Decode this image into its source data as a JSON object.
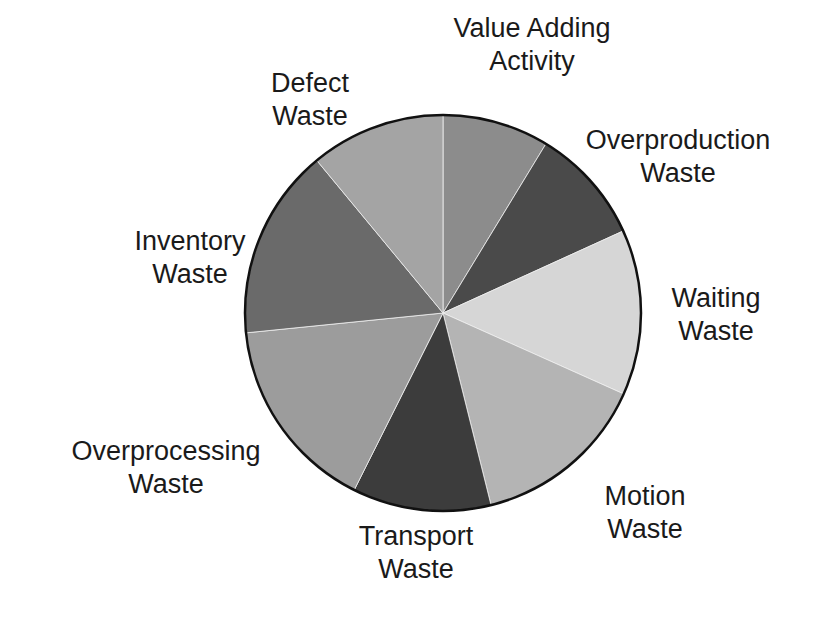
{
  "chart_data": {
    "type": "pie",
    "title": "",
    "categories": [
      "Value Adding Activity",
      "Overproduction Waste",
      "Waiting Waste",
      "Motion Waste",
      "Transport Waste",
      "Overprocessing Waste",
      "Inventory Waste",
      "Defect Waste"
    ],
    "values": [
      8.7,
      9.5,
      13.5,
      14.4,
      11.3,
      16.0,
      15.6,
      11.0
    ],
    "colors": [
      "#8c8c8c",
      "#4a4a4a",
      "#d6d6d6",
      "#b4b4b4",
      "#3c3c3c",
      "#9c9c9c",
      "#6a6a6a",
      "#a4a4a4"
    ],
    "start_angle_deg": 0,
    "direction": "clockwise",
    "legend": "none (direct labels)"
  },
  "labels": [
    {
      "line1": "Value Adding",
      "line2": "Activity",
      "x": 532,
      "y": 12
    },
    {
      "line1": "Overproduction",
      "line2": "Waste",
      "x": 678,
      "y": 124
    },
    {
      "line1": "Waiting",
      "line2": "Waste",
      "x": 716,
      "y": 282
    },
    {
      "line1": "Motion",
      "line2": "Waste",
      "x": 645,
      "y": 480
    },
    {
      "line1": "Transport",
      "line2": "Waste",
      "x": 416,
      "y": 520
    },
    {
      "line1": "Overprocessing",
      "line2": "Waste",
      "x": 166,
      "y": 435
    },
    {
      "line1": "Inventory",
      "line2": "Waste",
      "x": 190,
      "y": 225
    },
    {
      "line1": "Defect",
      "line2": "Waste",
      "x": 310,
      "y": 67
    }
  ]
}
